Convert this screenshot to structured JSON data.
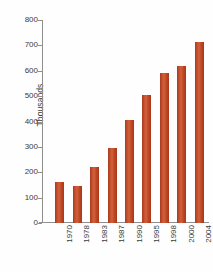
{
  "chart_data": {
    "type": "bar",
    "title": "",
    "subtitle": "",
    "xlabel": "",
    "ylabel": "Thousands",
    "categories": [
      "1970",
      "1978",
      "1983",
      "1987",
      "1990",
      "1995",
      "1998",
      "2000",
      "2004"
    ],
    "values": [
      160,
      145,
      220,
      295,
      405,
      505,
      593,
      620,
      712
    ],
    "ylim": [
      0,
      800
    ],
    "ytick_labels": [
      "800",
      "700",
      "600",
      "500",
      "400",
      "300",
      "200",
      "100",
      "0"
    ],
    "ytick_values": [
      800,
      700,
      600,
      500,
      400,
      300,
      200,
      100,
      0
    ],
    "grid": false,
    "legend": null,
    "legend_position": "none",
    "series": [
      {
        "name": "",
        "values": [
          160,
          145,
          220,
          295,
          405,
          505,
          593,
          620,
          712
        ]
      }
    ],
    "colors": {
      "bar": "#be4526",
      "bar_highlight": "#d2603b",
      "bar_shadow": "#a7381c",
      "axis": "#8f8f8f",
      "text": "#3b3b3b",
      "background": "#fefefe"
    }
  }
}
